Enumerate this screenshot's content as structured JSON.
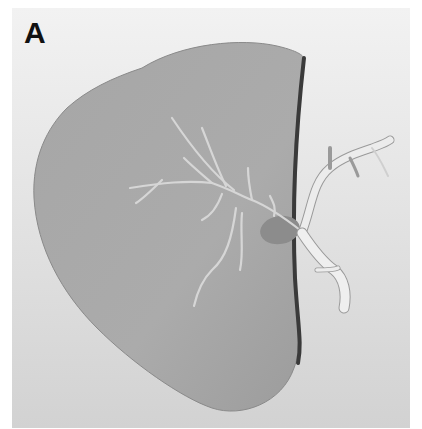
{
  "figure": {
    "panel_label": "A",
    "colors": {
      "background_top": "#f2f2f2",
      "background_bottom": "#d2d2d2",
      "organ_fill": "#a8a8a8",
      "organ_edge": "#3a3a3a",
      "duct_fill": "#ececec",
      "duct_stroke": "#9a9a9a",
      "gallbladder": "#8c8c8c"
    }
  }
}
